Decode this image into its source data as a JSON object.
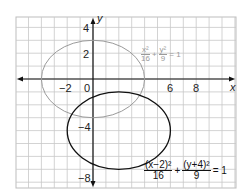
{
  "chart_data": {
    "type": "line",
    "title": "",
    "xlabel": "x",
    "ylabel": "y",
    "xlim": [
      -6,
      11
    ],
    "ylim": [
      -8.5,
      4.8
    ],
    "grid": true,
    "x_tick_labels": [
      "-2",
      "0",
      "6",
      "8"
    ],
    "y_tick_labels": [
      "4",
      "2",
      "-4",
      "-8"
    ],
    "series": [
      {
        "name": "x^2/16 + y^2/9 = 1",
        "shape": "ellipse",
        "center": [
          0,
          0
        ],
        "semi_axis_x": 4,
        "semi_axis_y": 3,
        "color": "#9a9a9a"
      },
      {
        "name": "(x-2)^2/16 + (y+4)^2/9 = 1",
        "shape": "ellipse",
        "center": [
          2,
          -4
        ],
        "semi_axis_x": 4,
        "semi_axis_y": 3,
        "color": "#111111"
      }
    ]
  },
  "labels": {
    "x_axis": "x",
    "y_axis": "y",
    "ticks": {
      "xm2": "−2",
      "x0": "0",
      "x6": "6",
      "x8": "8",
      "y4": "4",
      "y2": "2",
      "ym4": "−4",
      "ym8": "−8"
    },
    "eq1": {
      "n1": "x²",
      "d1": "16",
      "plus": "+",
      "n2": "y²",
      "d2": "9",
      "rhs": "= 1"
    },
    "eq2": {
      "n1": "(x−2)²",
      "d1": "16",
      "plus": "+",
      "n2": "(y+4)²",
      "d2": "9",
      "rhs": "= 1"
    }
  }
}
